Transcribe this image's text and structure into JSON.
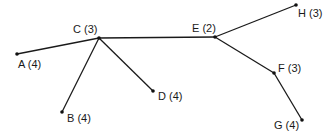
{
  "diagram": {
    "type": "tree",
    "line_color": "#1a1a1a",
    "node_color": "#111111",
    "nodes": [
      {
        "id": "A",
        "label": "A (4)",
        "x": 17,
        "y": 54,
        "lx": 18,
        "ly": 68,
        "anchor": "start"
      },
      {
        "id": "C",
        "label": "C (3)",
        "x": 99,
        "y": 38,
        "lx": 73,
        "ly": 33,
        "anchor": "start"
      },
      {
        "id": "B",
        "label": "B (4)",
        "x": 62,
        "y": 112,
        "lx": 67,
        "ly": 122,
        "anchor": "start"
      },
      {
        "id": "D",
        "label": "D (4)",
        "x": 153,
        "y": 91,
        "lx": 158,
        "ly": 100,
        "anchor": "start"
      },
      {
        "id": "E",
        "label": "E (2)",
        "x": 215,
        "y": 37,
        "lx": 192,
        "ly": 32,
        "anchor": "start"
      },
      {
        "id": "H",
        "label": "H (3)",
        "x": 296,
        "y": 5,
        "lx": 298,
        "ly": 17,
        "anchor": "start"
      },
      {
        "id": "F",
        "label": "F (3)",
        "x": 274,
        "y": 73,
        "lx": 278,
        "ly": 72,
        "anchor": "start"
      },
      {
        "id": "G",
        "label": "G (4)",
        "x": 302,
        "y": 120,
        "lx": 274,
        "ly": 129,
        "anchor": "start"
      }
    ],
    "edges": [
      {
        "from": "A",
        "to": "C"
      },
      {
        "from": "C",
        "to": "B"
      },
      {
        "from": "C",
        "to": "D"
      },
      {
        "from": "C",
        "to": "E"
      },
      {
        "from": "E",
        "to": "H"
      },
      {
        "from": "E",
        "to": "F"
      },
      {
        "from": "F",
        "to": "G"
      }
    ]
  }
}
